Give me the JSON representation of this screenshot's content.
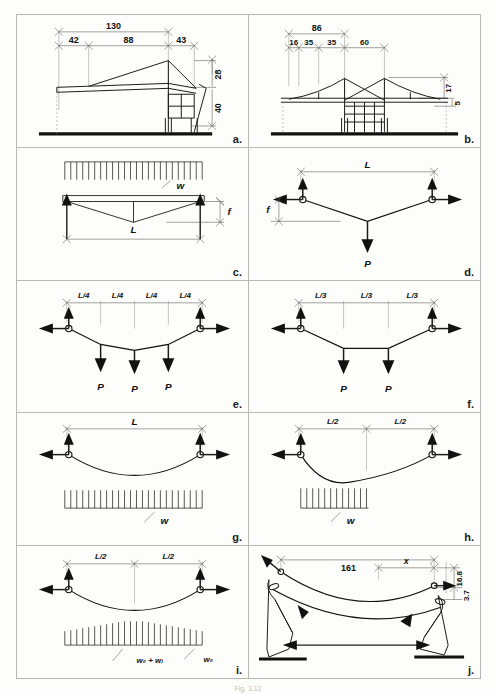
{
  "figure": {
    "caption": "Fig. 3.12",
    "panel_count": 10
  },
  "panels": [
    {
      "id": "a",
      "tag": "a.",
      "name": "building-section-single-mast",
      "type": "architectural-section",
      "dimensions_top": [
        "130"
      ],
      "dimensions_mid": [
        "42",
        "88",
        "43"
      ],
      "dimensions_right": [
        "28",
        "40"
      ]
    },
    {
      "id": "b",
      "tag": "b.",
      "name": "building-section-twin-mast",
      "type": "architectural-section",
      "dimensions_top": [
        "86"
      ],
      "dimensions_mid": [
        "16",
        "35",
        "35",
        "60"
      ],
      "dimensions_right": [
        "17",
        "5"
      ]
    },
    {
      "id": "c",
      "tag": "c.",
      "name": "cable-uniform-load-on-deck",
      "type": "load-diagram",
      "load_label": "w",
      "span_label": "L",
      "sag_label": "f",
      "load_kind": "distributed-above",
      "cable_shape": "vee"
    },
    {
      "id": "d",
      "tag": "d.",
      "name": "cable-single-point-load",
      "type": "load-diagram",
      "span_label": "L",
      "sag_label": "f",
      "point_loads": [
        "P"
      ],
      "cable_shape": "vee"
    },
    {
      "id": "e",
      "tag": "e.",
      "name": "cable-three-point-loads-quarter-span",
      "type": "load-diagram",
      "segments": [
        "L/4",
        "L/4",
        "L/4",
        "L/4"
      ],
      "point_loads": [
        "P",
        "P",
        "P"
      ],
      "cable_shape": "polygonal"
    },
    {
      "id": "f",
      "tag": "f.",
      "name": "cable-two-point-loads-third-span",
      "type": "load-diagram",
      "segments": [
        "L/3",
        "L/3",
        "L/3"
      ],
      "point_loads": [
        "P",
        "P"
      ],
      "cable_shape": "polygonal"
    },
    {
      "id": "g",
      "tag": "g.",
      "name": "cable-uniform-load-full-span",
      "type": "load-diagram",
      "span_label": "L",
      "load_label": "w",
      "load_kind": "distributed-below-full",
      "cable_shape": "parabola"
    },
    {
      "id": "h",
      "tag": "h.",
      "name": "cable-uniform-load-half-span",
      "type": "load-diagram",
      "segments": [
        "L/2",
        "L/2"
      ],
      "load_label": "w",
      "load_kind": "distributed-below-half",
      "cable_shape": "asymmetric-parabola"
    },
    {
      "id": "i",
      "tag": "i.",
      "name": "cable-dead-plus-live-load",
      "type": "load-diagram",
      "segments": [
        "L/2",
        "L/2"
      ],
      "load_labels": [
        "w₀ + wₗ",
        "w₀"
      ],
      "load_kind": "distributed-below-varying",
      "cable_shape": "parabola"
    },
    {
      "id": "j",
      "tag": "j.",
      "name": "cable-roof-perspective-force-flow",
      "type": "perspective-force-diagram",
      "dimensions": [
        "161",
        "x",
        "16.8",
        "3.7"
      ]
    }
  ],
  "symbols": {
    "support_pin": "pin-support-circle",
    "reaction_vertical": "up-arrow",
    "reaction_horizontal": "outward-arrow",
    "load_arrow": "down-arrow"
  },
  "colors": {
    "ink": "#1b1b1b",
    "rule": "#b9b9b4",
    "paper": "#fdfdfb"
  }
}
